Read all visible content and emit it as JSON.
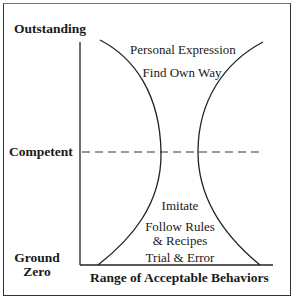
{
  "diagram": {
    "y_axis_labels": {
      "top": "Outstanding",
      "middle": "Competent",
      "bottom_line1": "Ground",
      "bottom_line2": "Zero"
    },
    "x_axis_label": "Range of Acceptable Behaviors",
    "upper_region": {
      "line1": "Personal Expression",
      "line2": "Find Own Way"
    },
    "lower_region": {
      "line1": "Imitate",
      "line2": "Follow Rules",
      "line3": "& Recipes",
      "line4": "Trial & Error"
    },
    "colors": {
      "ink": "#1a1a1a",
      "background": "#ffffff"
    }
  }
}
